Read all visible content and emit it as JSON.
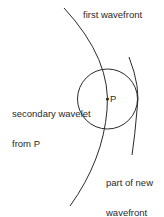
{
  "diagram": {
    "labels": {
      "first_wavefront": "first wavefront",
      "secondary_wavelet_line1": "secondary wavelet",
      "secondary_wavelet_line2": "from P",
      "point": "P",
      "new_wavefront_line1": "part of new",
      "new_wavefront_line2": "wavefront"
    },
    "colors": {
      "stroke": "#2a2a2a",
      "background": "#ffffff"
    },
    "shapes": {
      "first_wavefront": "arc",
      "secondary_wavelet": "circle centered at P",
      "new_wavefront": "arc tangent to wavelet"
    }
  }
}
